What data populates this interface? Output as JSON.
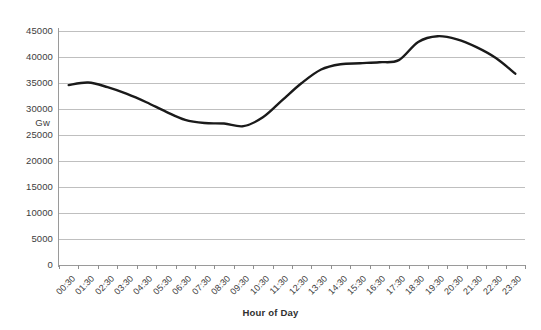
{
  "chart_data": {
    "type": "line",
    "title": "",
    "xlabel": "Hour of Day",
    "ylabel": "Gw",
    "ylim": [
      0,
      47000
    ],
    "yticks": [
      0,
      5000,
      10000,
      15000,
      20000,
      25000,
      30000,
      35000,
      40000,
      45000
    ],
    "ytick_labels": [
      "0",
      "5000",
      "10000",
      "15000",
      "20000",
      "25000",
      "30000",
      "35000",
      "40000",
      "45000"
    ],
    "grid": true,
    "legend": "none",
    "categories": [
      "00:30",
      "01:30",
      "02:30",
      "03:30",
      "04:30",
      "05:30",
      "06:30",
      "07:30",
      "08:30",
      "09:30",
      "10:30",
      "11:30",
      "12:30",
      "13:30",
      "14:30",
      "15:30",
      "16:30",
      "17:30",
      "18:30",
      "19:30",
      "20:30",
      "21:30",
      "22:30",
      "23:30"
    ],
    "values": [
      34600,
      35100,
      34200,
      32900,
      31300,
      29500,
      27900,
      27300,
      27200,
      26700,
      28400,
      31700,
      35000,
      37600,
      38600,
      38800,
      39000,
      39400,
      42900,
      44000,
      43400,
      41900,
      39800,
      36800
    ],
    "series_color": "#1a1a1a",
    "grid_color": "#bfbfbf",
    "axis_color": "#9a9a9a",
    "background": "#ffffff"
  },
  "axes": {
    "y_title": "Gw",
    "x_title": "Hour of Day"
  }
}
